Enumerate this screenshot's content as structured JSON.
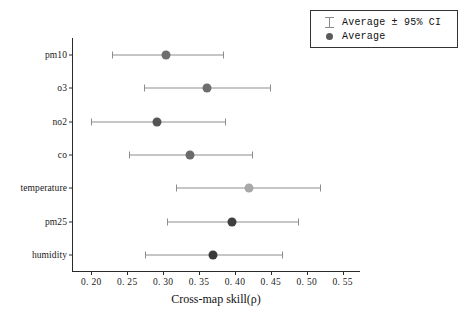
{
  "chart_data": {
    "type": "scatter",
    "title": "",
    "xlabel": "Cross-map skill(ρ)",
    "ylabel": "",
    "xlim": [
      0.1745,
      0.5755
    ],
    "xticks": [
      0.2,
      0.25,
      0.3,
      0.35,
      0.4,
      0.45,
      0.5,
      0.55
    ],
    "xtick_labels": [
      "0. 20",
      "0. 25",
      "0. 30",
      "0. 35",
      "0. 40",
      "0. 45",
      "0. 50",
      "0. 55"
    ],
    "categories": [
      "pm10",
      "o3",
      "no2",
      "co",
      "temperature",
      "pm25",
      "humidity"
    ],
    "grid": false,
    "orientation": "horizontal",
    "legend_position": "upper right",
    "points": [
      {
        "label": "pm10",
        "average": 0.304,
        "ci_low": 0.229,
        "ci_high": 0.383,
        "color": "#6e6e6e"
      },
      {
        "label": "o3",
        "average": 0.361,
        "ci_low": 0.273,
        "ci_high": 0.449,
        "color": "#6e6e6e"
      },
      {
        "label": "no2",
        "average": 0.291,
        "ci_low": 0.2,
        "ci_high": 0.386,
        "color": "#555555"
      },
      {
        "label": "co",
        "average": 0.338,
        "ci_low": 0.252,
        "ci_high": 0.424,
        "color": "#6a6a6a"
      },
      {
        "label": "temperature",
        "average": 0.419,
        "ci_low": 0.318,
        "ci_high": 0.519,
        "color": "#a8a8a8"
      },
      {
        "label": "pm25",
        "average": 0.396,
        "ci_low": 0.305,
        "ci_high": 0.488,
        "color": "#3f3f3f"
      },
      {
        "label": "humidity",
        "average": 0.369,
        "ci_low": 0.275,
        "ci_high": 0.465,
        "color": "#3a3a3a"
      }
    ],
    "series": [
      {
        "name": "Average",
        "values": [
          0.304,
          0.361,
          0.291,
          0.338,
          0.419,
          0.396,
          0.369
        ]
      },
      {
        "name": "ci_low",
        "values": [
          0.229,
          0.273,
          0.2,
          0.252,
          0.318,
          0.305,
          0.275
        ]
      },
      {
        "name": "ci_high",
        "values": [
          0.383,
          0.449,
          0.386,
          0.424,
          0.519,
          0.488,
          0.465
        ]
      }
    ]
  },
  "legend": {
    "entries": [
      {
        "key": "errorbar-icon",
        "label": "Average ± 95% CI"
      },
      {
        "key": "dot-icon",
        "label": "Average"
      }
    ]
  },
  "colors": {
    "axis": "#2a2a2a",
    "errorbar": "#8d8d8d",
    "background": "#ffffff"
  }
}
